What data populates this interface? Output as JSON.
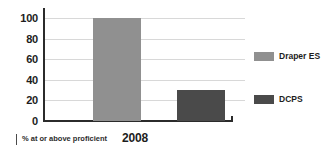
{
  "chart_data": {
    "type": "bar",
    "title": "",
    "subtitle": "",
    "categories": [
      "2008"
    ],
    "series": [
      {
        "name": "Draper ES",
        "values": [
          100
        ],
        "color": "#909090"
      },
      {
        "name": "DCPS",
        "values": [
          30
        ],
        "color": "#4a4a4a"
      }
    ],
    "xlabel": "% at or above proficient",
    "ylabel": "",
    "ylim": [
      0,
      110
    ],
    "y_ticks": [
      0,
      20,
      40,
      60,
      80,
      100
    ],
    "y_tick_labels": [
      "0",
      "20",
      "40",
      "60",
      "80",
      "100"
    ],
    "grid": true,
    "grid_color": "#d8d8d8",
    "legend_position": "right",
    "axis_color": "#2b2b2b",
    "background": "#ffffff"
  },
  "axis": {
    "caption": "% at or above proficient",
    "category_label": "2008"
  },
  "legend": {
    "items": [
      {
        "label": "Draper ES",
        "color": "#909090"
      },
      {
        "label": "DCPS",
        "color": "#4a4a4a"
      }
    ]
  }
}
